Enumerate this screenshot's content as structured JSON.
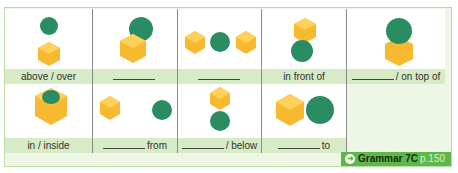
{
  "colors": {
    "cube": "#f7b92f",
    "cube_light": "#ffd15a",
    "cube_dark": "#e69f1c",
    "sphere": "#2a8c62",
    "sphere_light": "#3fab7c",
    "label_band": "#d6ebc6",
    "panel_bg": "#eef7e6",
    "badge": "#5db947"
  },
  "grid": {
    "row1": [
      {
        "label_text": "above / over",
        "blank": false
      },
      {
        "label_text": "",
        "blank": true
      },
      {
        "label_text": "",
        "blank": true
      },
      {
        "label_text": "in front of",
        "blank": false
      },
      {
        "label_text": "/ on top of",
        "blank": true
      }
    ],
    "row2": [
      {
        "label_text": "in / inside",
        "blank": false
      },
      {
        "label_text": "from",
        "blank": true
      },
      {
        "label_text": "/ below",
        "blank": true
      },
      {
        "label_text": "to",
        "blank": true
      }
    ]
  },
  "footer": {
    "link_icon": "arrow-circle-right-icon",
    "arrow_glyph": "➜",
    "grammar_ref": "Grammar 7C",
    "page_ref": "p.150"
  }
}
